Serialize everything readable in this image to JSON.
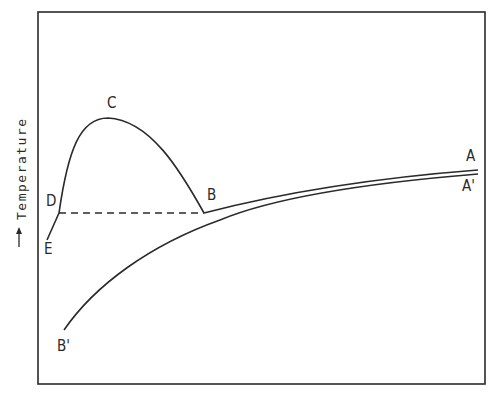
{
  "diagram": {
    "type": "temperature profile diagram",
    "y_axis_label": "Temperature",
    "y_axis_arrow": "up-arrow",
    "frame": {
      "left": 38,
      "top": 12,
      "right": 485,
      "bottom": 384
    },
    "curves": [
      {
        "name": "A-B-C-D-E",
        "description": "upper curve from A through B, peak at C, down to D then E",
        "style": "solid"
      },
      {
        "name": "A'-B'",
        "description": "lower curve from A' down to B'",
        "style": "solid"
      },
      {
        "name": "D-B",
        "description": "horizontal dashed line between D and B",
        "style": "dashed"
      }
    ],
    "point_labels": {
      "A": "A",
      "A_prime": "A'",
      "B": "B",
      "B_prime": "B'",
      "C": "C",
      "D": "D",
      "E": "E"
    },
    "line_color": "#2a2a2a"
  }
}
